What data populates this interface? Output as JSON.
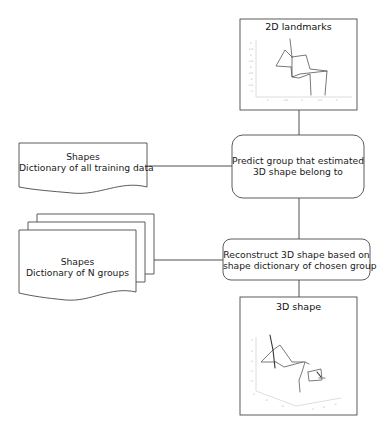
{
  "diagram": {
    "type": "flowchart",
    "nodes": {
      "landmarks_2d": {
        "title": "2D landmarks",
        "kind": "image-box"
      },
      "predict_group": {
        "lines": [
          "Predict group that estimated",
          "3D shape belong to"
        ],
        "kind": "rounded-process"
      },
      "dict_all": {
        "lines": [
          "Shapes",
          "Dictionary of all training data"
        ],
        "kind": "document"
      },
      "reconstruct": {
        "lines": [
          "Reconstruct 3D shape based on",
          "shape dictionary of chosen group"
        ],
        "kind": "rounded-process"
      },
      "dict_groups": {
        "lines": [
          "Shapes",
          "Dictionary of N groups"
        ],
        "kind": "multi-document"
      },
      "shape_3d": {
        "title": "3D shape",
        "kind": "image-box"
      }
    },
    "edges": [
      {
        "from": "landmarks_2d",
        "to": "predict_group"
      },
      {
        "from": "dict_all",
        "to": "predict_group"
      },
      {
        "from": "predict_group",
        "to": "reconstruct"
      },
      {
        "from": "dict_groups",
        "to": "reconstruct"
      },
      {
        "from": "reconstruct",
        "to": "shape_3d"
      }
    ],
    "colors": {
      "stroke": "#4a4a4a",
      "plot_line": "#6b6b6b",
      "plot_dark": "#333333",
      "axis": "#bdbdbd"
    }
  }
}
